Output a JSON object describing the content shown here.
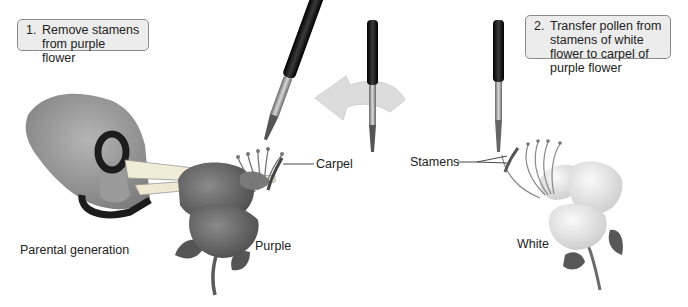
{
  "figure": {
    "step1": {
      "number": "1.",
      "text": "Remove stamens from purple flower"
    },
    "step2": {
      "number": "2.",
      "text": "Transfer pollen from stamens of white flower to carpel of purple flower"
    },
    "labels": {
      "carpel": "Carpel",
      "stamens": "Stamens",
      "purple": "Purple",
      "white": "White",
      "parental_generation": "Parental generation"
    },
    "palette": {
      "callout_fill": "#ececec",
      "callout_border": "#8a8a8a",
      "brush_handle": "#1a1a1a",
      "purple_flower_gray": "#6e6e6e",
      "white_flower_gray": "#e6e6e6",
      "arrow_gray": "#dcdcdc"
    }
  }
}
